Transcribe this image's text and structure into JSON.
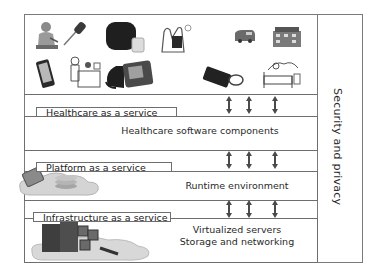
{
  "diagram": {
    "devices_panel": {
      "icons": [
        "elderly-patient-icon",
        "digital-thermometer-icon",
        "smart-hub-device-icon",
        "hand-holding-keys-icon",
        "ambulance-icon",
        "hospital-building-icon",
        "smartphone-icon",
        "caregiver-reception-icon",
        "blood-pressure-monitor-icon",
        "tablet-with-stethoscope-icon",
        "patient-in-bed-icon"
      ]
    },
    "layers": [
      {
        "tab_label": "Healthcare as a service",
        "content_lines": [
          "Healthcare software components"
        ]
      },
      {
        "tab_label": "Platform as a service",
        "content_lines": [
          "Runtime environment"
        ]
      },
      {
        "tab_label": "Infrastructure as a service",
        "content_lines": [
          "Virtualized servers",
          "Storage and networking"
        ]
      }
    ],
    "side_column": {
      "label": "Security and privacy"
    },
    "connectors": {
      "arrows_per_gap": 3,
      "style": "double-headed vertical arrow"
    },
    "colors": {
      "border": "#6e6e6e",
      "text": "#2a2a2a",
      "arrow": "#4a4a4a",
      "background": "#ffffff"
    }
  }
}
